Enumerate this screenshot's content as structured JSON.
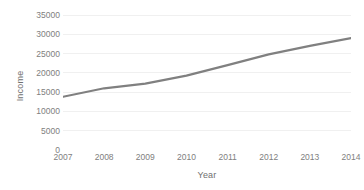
{
  "chart_data": {
    "type": "line",
    "title": "",
    "subtitle": "",
    "xlabel": "Year",
    "ylabel": "Income",
    "x": [
      2007,
      2008,
      2009,
      2010,
      2011,
      2012,
      2013,
      2014
    ],
    "categories": [
      "2007",
      "2008",
      "2009",
      "2010",
      "2011",
      "2012",
      "2013",
      "2014"
    ],
    "values": [
      13800,
      16000,
      17200,
      19300,
      22000,
      24800,
      27000,
      29000
    ],
    "series": [
      {
        "name": "Income",
        "values": [
          13800,
          16000,
          17200,
          19300,
          22000,
          24800,
          27000,
          29000
        ]
      }
    ],
    "xlim": [
      2007,
      2014
    ],
    "ylim": [
      0,
      35000
    ],
    "ytick_values": [
      0,
      5000,
      10000,
      15000,
      20000,
      25000,
      30000,
      35000
    ],
    "ytick_labels": [
      "0",
      "5000",
      "10000",
      "15000",
      "20000",
      "25000",
      "30000",
      "35000"
    ],
    "xtick_labels": [
      "2007",
      "2008",
      "2009",
      "2010",
      "2011",
      "2012",
      "2013",
      "2014"
    ],
    "grid": "horizontal",
    "legend": "none",
    "markers": false,
    "annotations": []
  },
  "style": {
    "background_color": "#ffffff",
    "gridline_color": "#f0f0f0",
    "line_color": "#808080",
    "line_width": 2.2,
    "tick_label_color": "#808080",
    "axis_title_color": "#6f6f6f"
  }
}
